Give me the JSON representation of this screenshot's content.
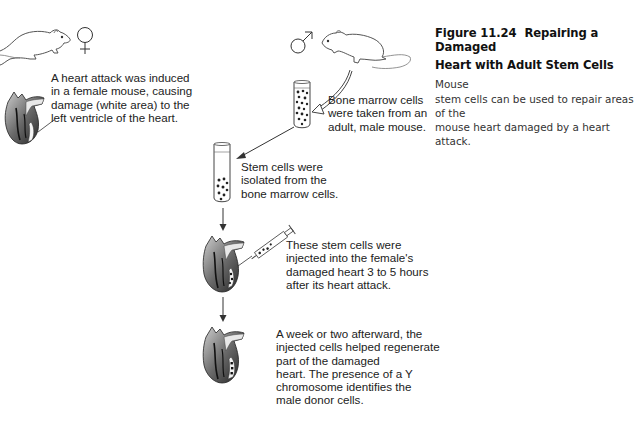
{
  "figure": {
    "number": "Figure 11.24",
    "title_line1": "Repairing a Damaged",
    "title_line2": "Heart with Adult Stem Cells",
    "caption_line2_tail": "Mouse",
    "caption_line3": "stem cells can be used to repair areas of the",
    "caption_line4": "mouse heart damaged by a heart attack."
  },
  "symbols": {
    "female": "female-symbol",
    "male": "male-symbol"
  },
  "steps": [
    {
      "id": "heart-attack",
      "lines": [
        "A heart attack was induced",
        "in a female mouse, causing",
        "damage (white area) to the",
        "left ventricle of the heart."
      ]
    },
    {
      "id": "bone-marrow",
      "lines": [
        "Bone marrow cells",
        "were taken from an",
        "adult, male mouse."
      ]
    },
    {
      "id": "stem-isolation",
      "lines": [
        "Stem cells were",
        "isolated from the",
        "bone marrow cells."
      ]
    },
    {
      "id": "injection",
      "lines": [
        "These stem cells were",
        "injected into the female's",
        "damaged heart 3 to 5 hours",
        "after its heart attack."
      ]
    },
    {
      "id": "regeneration",
      "lines": [
        "A week or two afterward, the",
        "injected cells helped regenerate",
        "part of the damaged",
        "heart. The presence of a Y",
        "chromosome identifies the",
        "male donor cells."
      ]
    }
  ]
}
